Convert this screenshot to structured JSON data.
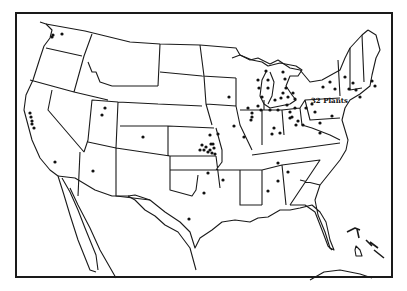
{
  "map": {
    "title": "",
    "region": "Continental United States",
    "annotation": "32 Plants",
    "annotation_position": {
      "x": 325,
      "y": 103
    },
    "colors": {
      "outline": "#1a1a1a",
      "dot": "#111111",
      "background": "#ffffff"
    },
    "plant_dots": [
      [
        53,
        35
      ],
      [
        62,
        34
      ],
      [
        52,
        37
      ],
      [
        30,
        113
      ],
      [
        31,
        117
      ],
      [
        32,
        121
      ],
      [
        32,
        124
      ],
      [
        34,
        128
      ],
      [
        55,
        162
      ],
      [
        105,
        108
      ],
      [
        102,
        115
      ],
      [
        143,
        137
      ],
      [
        93,
        171
      ],
      [
        229,
        97
      ],
      [
        210,
        135
      ],
      [
        218,
        134
      ],
      [
        211,
        144
      ],
      [
        210,
        150
      ],
      [
        208,
        152
      ],
      [
        204,
        150
      ],
      [
        200,
        150
      ],
      [
        202,
        145
      ],
      [
        206,
        147
      ],
      [
        213,
        144
      ],
      [
        214,
        148
      ],
      [
        212,
        153
      ],
      [
        215,
        154
      ],
      [
        208,
        173
      ],
      [
        204,
        193
      ],
      [
        189,
        219
      ],
      [
        223,
        180
      ],
      [
        234,
        126
      ],
      [
        244,
        137
      ],
      [
        248,
        108
      ],
      [
        252,
        113
      ],
      [
        252,
        117
      ],
      [
        251,
        120
      ],
      [
        258,
        80
      ],
      [
        259,
        88
      ],
      [
        262,
        97
      ],
      [
        258,
        106
      ],
      [
        261,
        110
      ],
      [
        270,
        110
      ],
      [
        278,
        110
      ],
      [
        266,
        71
      ],
      [
        268,
        80
      ],
      [
        268,
        88
      ],
      [
        283,
        72
      ],
      [
        285,
        79
      ],
      [
        286,
        88
      ],
      [
        283,
        93
      ],
      [
        275,
        100
      ],
      [
        281,
        98
      ],
      [
        288,
        97
      ],
      [
        293,
        93
      ],
      [
        295,
        99
      ],
      [
        287,
        105
      ],
      [
        274,
        128
      ],
      [
        280,
        133
      ],
      [
        272,
        134
      ],
      [
        290,
        112
      ],
      [
        295,
        108
      ],
      [
        306,
        108
      ],
      [
        292,
        117
      ],
      [
        298,
        121
      ],
      [
        303,
        125
      ],
      [
        296,
        125
      ],
      [
        290,
        118
      ],
      [
        312,
        104
      ],
      [
        315,
        112
      ],
      [
        332,
        116
      ],
      [
        320,
        123
      ],
      [
        323,
        87
      ],
      [
        330,
        82
      ],
      [
        335,
        89
      ],
      [
        345,
        77
      ],
      [
        349,
        89
      ],
      [
        353,
        83
      ],
      [
        356,
        90
      ],
      [
        360,
        97
      ],
      [
        372,
        81
      ],
      [
        375,
        86
      ],
      [
        320,
        133
      ],
      [
        278,
        163
      ],
      [
        288,
        172
      ],
      [
        278,
        181
      ],
      [
        268,
        191
      ]
    ],
    "insets": [
      "Caribbean islands",
      "Cuba coast"
    ]
  }
}
